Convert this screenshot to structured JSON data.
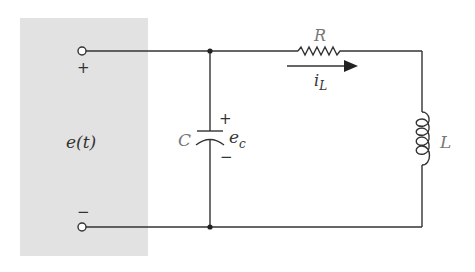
{
  "diagram": {
    "type": "circuit",
    "source": {
      "label": "e(t)",
      "positive_terminal": "+",
      "negative_terminal": "−"
    },
    "components": {
      "capacitor": {
        "label": "C",
        "voltage_label": "e",
        "voltage_subscript": "c",
        "plus": "+",
        "minus": "−"
      },
      "resistor": {
        "label": "R"
      },
      "current": {
        "label": "i",
        "subscript": "L"
      },
      "inductor": {
        "label": "L"
      }
    },
    "colors": {
      "panel": "#e2e2e2",
      "wire": "#333333",
      "background": "#ffffff"
    }
  }
}
